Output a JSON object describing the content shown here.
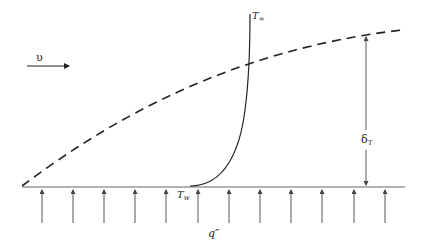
{
  "diagram": {
    "type": "thermal boundary layer over heated flat plate",
    "labels": {
      "velocity": "υ",
      "t_infinity_main": "T",
      "t_infinity_sub": "∞",
      "t_wall_main": "T",
      "t_wall_sub": "w",
      "delta_main": "δ",
      "delta_sub": "T",
      "heat_flux": "q″"
    },
    "colors": {
      "line": "#222222",
      "arrow": "#555555",
      "plate": "#666666",
      "background": "#ffffff"
    },
    "heat_flux_arrows_count": 12
  }
}
